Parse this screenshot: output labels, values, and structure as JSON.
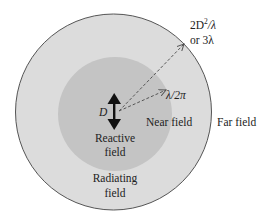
{
  "diagram": {
    "type": "antenna-field-regions",
    "regions": {
      "reactive": {
        "label_line1": "Reactive",
        "label_line2": "field"
      },
      "near": {
        "label": "Near field"
      },
      "radiating": {
        "label_line1": "Radiating",
        "label_line2": "field"
      },
      "far": {
        "label": "Far field"
      }
    },
    "antenna": {
      "label": "D",
      "icon": "double-arrow-icon"
    },
    "boundaries": {
      "inner": {
        "label": "λ/2π"
      },
      "outer": {
        "label_line1_prefix": "2D",
        "label_line1_sup": "2",
        "label_line1_suffix": "/λ",
        "label_line2": "or 3λ"
      }
    },
    "colors": {
      "background": "#ffffff",
      "outer_circle_fill": "#dcdcdc",
      "outer_circle_stroke": "#555555",
      "inner_circle_fill": "#c4c4c4",
      "arrow": "#111111",
      "dashed_arrow": "#555555",
      "text": "#222222"
    }
  }
}
